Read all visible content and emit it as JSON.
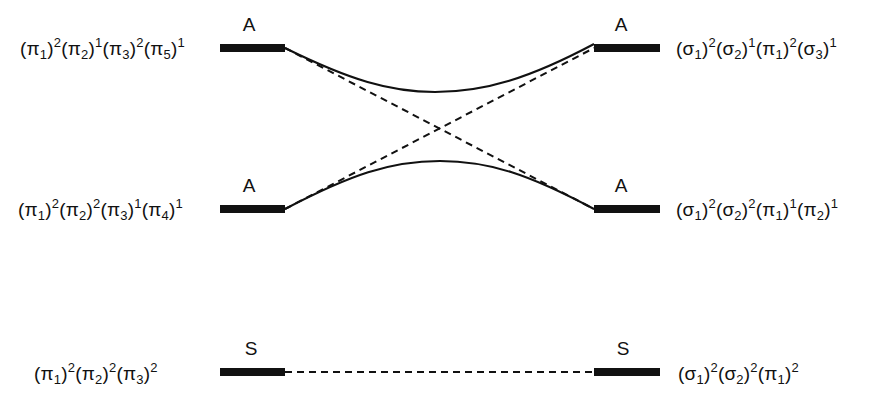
{
  "diagram": {
    "type": "state-correlation-diagram",
    "colors": {
      "ink": "#111111",
      "background": "#ffffff"
    },
    "left_states": [
      {
        "id": "left-upper",
        "symmetry": "A",
        "configuration": [
          {
            "orbital": "π",
            "index": "1",
            "occupancy": "2"
          },
          {
            "orbital": "π",
            "index": "2",
            "occupancy": "1"
          },
          {
            "orbital": "π",
            "index": "3",
            "occupancy": "2"
          },
          {
            "orbital": "π",
            "index": "5",
            "occupancy": "1"
          }
        ],
        "text": "(π1)2(π2)1(π3)2(π5)1"
      },
      {
        "id": "left-middle",
        "symmetry": "A",
        "configuration": [
          {
            "orbital": "π",
            "index": "1",
            "occupancy": "2"
          },
          {
            "orbital": "π",
            "index": "2",
            "occupancy": "2"
          },
          {
            "orbital": "π",
            "index": "3",
            "occupancy": "1"
          },
          {
            "orbital": "π",
            "index": "4",
            "occupancy": "1"
          }
        ],
        "text": "(π1)2(π2)2(π3)1(π4)1"
      },
      {
        "id": "left-lower",
        "symmetry": "S",
        "configuration": [
          {
            "orbital": "π",
            "index": "1",
            "occupancy": "2"
          },
          {
            "orbital": "π",
            "index": "2",
            "occupancy": "2"
          },
          {
            "orbital": "π",
            "index": "3",
            "occupancy": "2"
          }
        ],
        "text": "(π1)2(π2)2(π3)2"
      }
    ],
    "right_states": [
      {
        "id": "right-upper",
        "symmetry": "A",
        "configuration": [
          {
            "orbital": "σ",
            "index": "1",
            "occupancy": "2"
          },
          {
            "orbital": "σ",
            "index": "2",
            "occupancy": "1"
          },
          {
            "orbital": "π",
            "index": "1",
            "occupancy": "2"
          },
          {
            "orbital": "σ",
            "index": "3",
            "occupancy": "1"
          }
        ],
        "text": "(σ1)2(σ2)1(π1)2(σ3)1"
      },
      {
        "id": "right-middle",
        "symmetry": "A",
        "configuration": [
          {
            "orbital": "σ",
            "index": "1",
            "occupancy": "2"
          },
          {
            "orbital": "σ",
            "index": "2",
            "occupancy": "2"
          },
          {
            "orbital": "π",
            "index": "1",
            "occupancy": "1"
          },
          {
            "orbital": "π",
            "index": "2",
            "occupancy": "1"
          }
        ],
        "text": "(σ1)2(σ2)2(π1)1(π2)1"
      },
      {
        "id": "right-lower",
        "symmetry": "S",
        "configuration": [
          {
            "orbital": "σ",
            "index": "1",
            "occupancy": "2"
          },
          {
            "orbital": "σ",
            "index": "2",
            "occupancy": "2"
          },
          {
            "orbital": "π",
            "index": "1",
            "occupancy": "2"
          }
        ],
        "text": "(σ1)2(σ2)2(π1)2"
      }
    ],
    "correlations": [
      {
        "from": "left-upper",
        "to": "right-middle",
        "style": "dashed",
        "meaning": "intended correlation"
      },
      {
        "from": "left-middle",
        "to": "right-upper",
        "style": "dashed",
        "meaning": "intended correlation"
      },
      {
        "from": "left-upper",
        "to": "right-upper",
        "style": "solid",
        "meaning": "avoided crossing (upper)"
      },
      {
        "from": "left-middle",
        "to": "right-middle",
        "style": "solid",
        "meaning": "avoided crossing (lower)"
      },
      {
        "from": "left-lower",
        "to": "right-lower",
        "style": "dashed",
        "meaning": "direct correlation"
      }
    ],
    "caption_partial": "(caption clipped at bottom edge — only glyph tops visible)"
  }
}
